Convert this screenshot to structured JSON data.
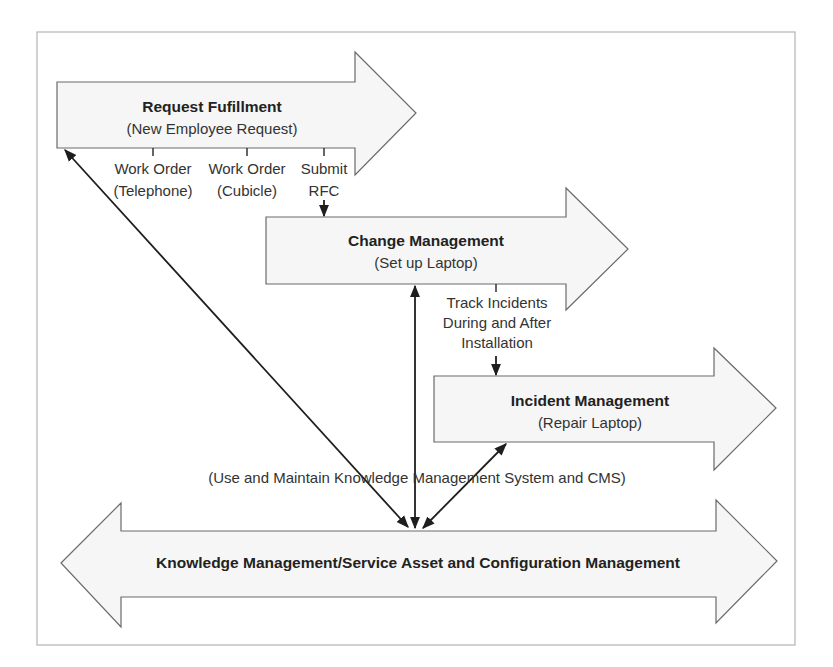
{
  "diagram": {
    "processes": [
      {
        "id": "request-fulfillment",
        "title": "Request Fufillment",
        "subtitle": "(New Employee Request)"
      },
      {
        "id": "change-management",
        "title": "Change Management",
        "subtitle": "(Set up Laptop)"
      },
      {
        "id": "incident-management",
        "title": "Incident Management",
        "subtitle": "(Repair Laptop)"
      }
    ],
    "foundation": {
      "title": "Knowledge Management/Service Asset and Configuration Management"
    },
    "outputs": [
      {
        "line1": "Work Order",
        "line2": "(Telephone)"
      },
      {
        "line1": "Work Order",
        "line2": "(Cubicle)"
      },
      {
        "line1": "Submit",
        "line2": "RFC"
      }
    ],
    "track_label": {
      "line1": "Track Incidents",
      "line2": "During and After",
      "line3": "Installation"
    },
    "kms_label": "(Use and Maintain Knowledge Management System and CMS)",
    "colors": {
      "arrow_fill": "#f6f6f6",
      "arrow_stroke": "#6a6a6a",
      "frame": "#b5b5b5",
      "text": "#222222"
    }
  }
}
